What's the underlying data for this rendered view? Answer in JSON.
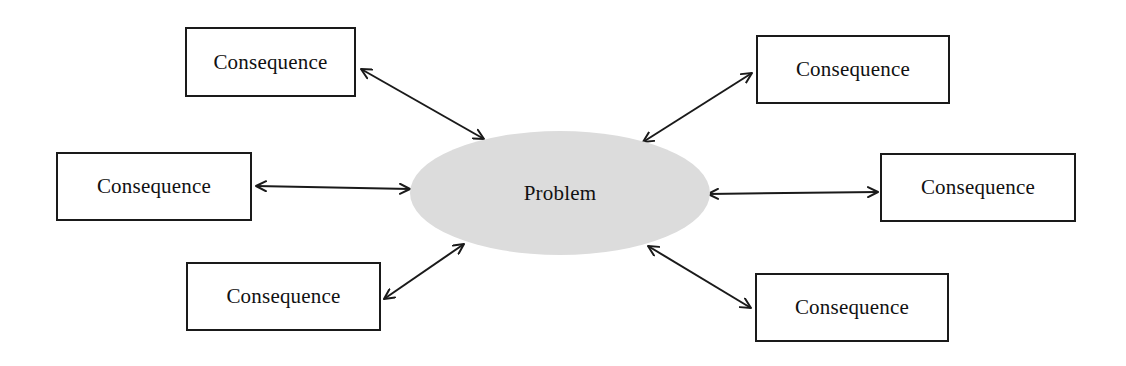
{
  "diagram": {
    "type": "hub-and-spoke",
    "center": {
      "id": "problem",
      "label": "Problem",
      "shape": "ellipse",
      "fill": "#dcdcdc",
      "cx": 560,
      "cy": 193,
      "rx": 150,
      "ry": 62
    },
    "nodes": [
      {
        "id": "consequence-top-left",
        "label": "Consequence",
        "x": 185,
        "y": 27,
        "w": 171,
        "h": 70
      },
      {
        "id": "consequence-top-right",
        "label": "Consequence",
        "x": 756,
        "y": 35,
        "w": 194,
        "h": 69
      },
      {
        "id": "consequence-middle-left",
        "label": "Consequence",
        "x": 56,
        "y": 152,
        "w": 196,
        "h": 69
      },
      {
        "id": "consequence-middle-right",
        "label": "Consequence",
        "x": 880,
        "y": 153,
        "w": 196,
        "h": 69
      },
      {
        "id": "consequence-bottom-left",
        "label": "Consequence",
        "x": 186,
        "y": 262,
        "w": 195,
        "h": 69
      },
      {
        "id": "consequence-bottom-right",
        "label": "Consequence",
        "x": 755,
        "y": 273,
        "w": 194,
        "h": 69
      }
    ],
    "edges": [
      {
        "from": "problem",
        "to": "consequence-top-left",
        "bidirectional": true,
        "x1": 484,
        "y1": 139,
        "x2": 361,
        "y2": 69
      },
      {
        "from": "problem",
        "to": "consequence-top-right",
        "bidirectional": true,
        "x1": 643,
        "y1": 142,
        "x2": 752,
        "y2": 73
      },
      {
        "from": "problem",
        "to": "consequence-middle-left",
        "bidirectional": true,
        "x1": 410,
        "y1": 189,
        "x2": 256,
        "y2": 186
      },
      {
        "from": "problem",
        "to": "consequence-middle-right",
        "bidirectional": true,
        "x1": 708,
        "y1": 194,
        "x2": 878,
        "y2": 192
      },
      {
        "from": "problem",
        "to": "consequence-bottom-left",
        "bidirectional": true,
        "x1": 464,
        "y1": 244,
        "x2": 384,
        "y2": 299
      },
      {
        "from": "problem",
        "to": "consequence-bottom-right",
        "bidirectional": true,
        "x1": 648,
        "y1": 246,
        "x2": 751,
        "y2": 308
      }
    ],
    "colors": {
      "stroke": "#1a1a1a",
      "ellipse_fill": "#dcdcdc",
      "background": "#ffffff"
    }
  }
}
